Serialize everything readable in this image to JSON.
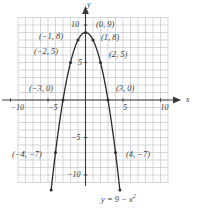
{
  "figure": {
    "name": "parabola-graph",
    "equation_label": "y = 9 − x",
    "equation_exponent": "2",
    "axis_x_name": "x",
    "axis_y_name": "y"
  },
  "axes": {
    "x_ticks": [
      {
        "value": -10,
        "label": "−10",
        "px": 10.5
      },
      {
        "value": -5,
        "label": "−5",
        "px": 48.0
      },
      {
        "value": 5,
        "label": "5",
        "px": 123.0
      },
      {
        "value": 10,
        "label": "10",
        "px": 160.5
      }
    ],
    "y_ticks": [
      {
        "value": 10,
        "label": "10",
        "px": 25.0
      },
      {
        "value": 5,
        "label": "5",
        "px": 62.5
      },
      {
        "value": -5,
        "label": "−5",
        "px": 137.5
      },
      {
        "value": -10,
        "label": "−10",
        "px": 175.0
      }
    ]
  },
  "chart_data": {
    "type": "line",
    "title": "",
    "subtitle": "",
    "xlabel": "x",
    "ylabel": "y",
    "xlim": [
      -9,
      11
    ],
    "ylim": [
      -11,
      11
    ],
    "grid": true,
    "legend": "none",
    "function": "y = 9 - x^2",
    "series": [
      {
        "name": "y = 9 - x^2",
        "x": [
          -4,
          -3,
          -2,
          -1,
          0,
          1,
          2,
          3,
          4
        ],
        "values": [
          -7,
          0,
          5,
          8,
          9,
          8,
          5,
          0,
          -7
        ]
      }
    ],
    "annotations": [
      {
        "point": [
          -4,
          -7
        ],
        "label": "(−4, −7)",
        "lx": 12,
        "ly": 150
      },
      {
        "point": [
          -3,
          0
        ],
        "label": "(−3, 0)",
        "lx": 29,
        "ly": 84
      },
      {
        "point": [
          -2,
          5
        ],
        "label": "(−2, 5)",
        "lx": 34,
        "ly": 47
      },
      {
        "point": [
          -1,
          8
        ],
        "label": "(−1, 8)",
        "lx": 39,
        "ly": 32
      },
      {
        "point": [
          0,
          9
        ],
        "label": "(0, 9)",
        "lx": 96,
        "ly": 20
      },
      {
        "point": [
          1,
          8
        ],
        "label": "(1, 8)",
        "lx": 101,
        "ly": 33
      },
      {
        "point": [
          2,
          5
        ],
        "label": "(2, 5)",
        "lx": 109,
        "ly": 50
      },
      {
        "point": [
          3,
          0
        ],
        "label": "(3, 0)",
        "lx": 116,
        "ly": 84
      },
      {
        "point": [
          4,
          -7
        ],
        "label": "(4, −7)",
        "lx": 126,
        "ly": 150
      }
    ],
    "endpoints": [
      {
        "x": -4.58,
        "y": -12.0
      },
      {
        "x": 4.58,
        "y": -12.0
      }
    ]
  },
  "style": {
    "grid_color": "#b9bcc4",
    "axis_color": "#3a3a3a",
    "curve_color": "#2a2a2a",
    "label_color": "#3a3a3a"
  }
}
